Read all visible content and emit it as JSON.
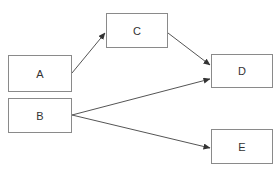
{
  "diagram": {
    "type": "flow",
    "colors": {
      "stroke": "#555555",
      "border": "#8a8a8a",
      "text": "#333333",
      "background": "#ffffff"
    },
    "nodes": [
      {
        "id": "A",
        "label": "A",
        "x": 8,
        "y": 55,
        "w": 64,
        "h": 37
      },
      {
        "id": "B",
        "label": "B",
        "x": 8,
        "y": 98,
        "w": 64,
        "h": 35
      },
      {
        "id": "C",
        "label": "C",
        "x": 106,
        "y": 13,
        "w": 62,
        "h": 35
      },
      {
        "id": "D",
        "label": "D",
        "x": 211,
        "y": 54,
        "w": 62,
        "h": 34
      },
      {
        "id": "E",
        "label": "E",
        "x": 211,
        "y": 129,
        "w": 62,
        "h": 35
      }
    ],
    "edges": [
      {
        "from": "A",
        "to": "C",
        "x1": 72,
        "y1": 73,
        "x2": 105,
        "y2": 33
      },
      {
        "from": "C",
        "to": "D",
        "x1": 168,
        "y1": 33,
        "x2": 210,
        "y2": 65
      },
      {
        "from": "B",
        "to": "D",
        "x1": 72,
        "y1": 115,
        "x2": 210,
        "y2": 79
      },
      {
        "from": "B",
        "to": "E",
        "x1": 72,
        "y1": 115,
        "x2": 210,
        "y2": 148
      }
    ]
  }
}
